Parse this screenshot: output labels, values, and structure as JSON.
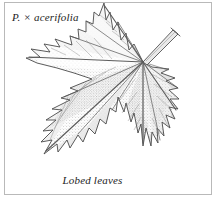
{
  "plate": {
    "background_color": "#ffffff",
    "frame_color": "#b9b9b9",
    "ink_color": "#1c1c1c",
    "width": 217,
    "height": 198
  },
  "labels": {
    "species_genus_abbrev": "P.",
    "species_hybrid_sign": "×",
    "species_epithet": "acerifolia",
    "species_full": "P. × acerifolia",
    "caption": "Lobed leaves"
  },
  "illustration": {
    "subject": "lobed-leaf",
    "technique": "stipple-engraving",
    "parts": [
      {
        "name": "petiole",
        "label": "leaf stalk"
      },
      {
        "name": "leaf-blade",
        "label": "lobed blade"
      },
      {
        "name": "midrib",
        "label": "midrib"
      },
      {
        "name": "lateral-veins",
        "label": "palmate veins"
      },
      {
        "name": "lobe-top",
        "label": "upper lobe"
      },
      {
        "name": "lobe-left",
        "label": "left lobe"
      },
      {
        "name": "lobe-right",
        "label": "right lobe"
      },
      {
        "name": "lobe-lower-left",
        "label": "lower left lobe"
      },
      {
        "name": "lobe-bottom",
        "label": "bottom lobe"
      }
    ],
    "palette": {
      "outline": "#4a4a4a",
      "vein": "#5c5c5c",
      "shade_dark": "#707070",
      "shade_mid": "#a8a8a8",
      "shade_light": "#d8d8d8",
      "highlight": "#f2f2f2"
    }
  }
}
